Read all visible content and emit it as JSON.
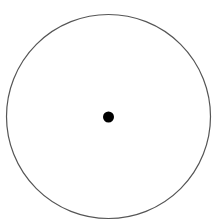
{
  "diagram": {
    "type": "circle-with-center-point",
    "background": "#ffffff",
    "circle": {
      "cx": 108.5,
      "cy": 116.5,
      "r": 102,
      "stroke": "#555555",
      "stroke_width": 1.2,
      "fill": "#ffffff"
    },
    "center_point": {
      "cx": 108.5,
      "cy": 117,
      "r": 5.5,
      "fill": "#000000"
    }
  }
}
